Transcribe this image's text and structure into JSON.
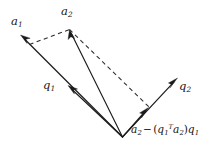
{
  "figure": {
    "kind": "vector-diagram",
    "width": 209,
    "height": 147,
    "background_color": "#ffffff",
    "stroke_color": "#1b1b1b",
    "dash_color": "#2a2a2a"
  },
  "labels": {
    "a1": {
      "base": "a",
      "sub": "1"
    },
    "a2": {
      "base": "a",
      "sub": "2"
    },
    "q1": {
      "base": "q",
      "sub": "1"
    },
    "q2": {
      "base": "q",
      "sub": "2"
    },
    "residual": {
      "term1_base": "a",
      "term1_sub": "2",
      "minus": "−",
      "open_paren": "(",
      "term2_base": "q",
      "term2_sub": "1",
      "term2_sup": "T",
      "term3_base": "a",
      "term3_sub": "2",
      "close_paren": ")",
      "term4_base": "q",
      "term4_sub": "1",
      "plain": "a2 − (q1T a2)q1"
    }
  },
  "geometry": {
    "origin": {
      "x": 122.5,
      "y": 137.0
    },
    "vectors": [
      {
        "name": "a1",
        "from": [
          122.5,
          137.0
        ],
        "to": [
          20.5,
          35.0
        ],
        "style": "solid",
        "arrow": "end"
      },
      {
        "name": "q1",
        "from": [
          122.5,
          137.0
        ],
        "to": [
          68.0,
          85.5
        ],
        "style": "solid",
        "arrow": "end"
      },
      {
        "name": "a2",
        "from": [
          122.5,
          137.0
        ],
        "to": [
          69.5,
          29.5
        ],
        "style": "solid",
        "arrow": "end"
      },
      {
        "name": "q2",
        "from": [
          122.5,
          137.0
        ],
        "to": [
          177.5,
          78.0
        ],
        "style": "solid",
        "arrow": "end"
      },
      {
        "name": "residual",
        "from": [
          122.5,
          137.0
        ],
        "to": [
          148.5,
          107.5
        ],
        "style": "solid",
        "arrow": "end"
      }
    ],
    "dashed": [
      {
        "name": "projection-to-a2-tip",
        "from": [
          29.5,
          44.5
        ],
        "to": [
          69.5,
          29.5
        ]
      },
      {
        "name": "a2-tip-to-residual-tip",
        "from": [
          69.5,
          29.5
        ],
        "to": [
          149.0,
          107.0
        ]
      }
    ]
  }
}
